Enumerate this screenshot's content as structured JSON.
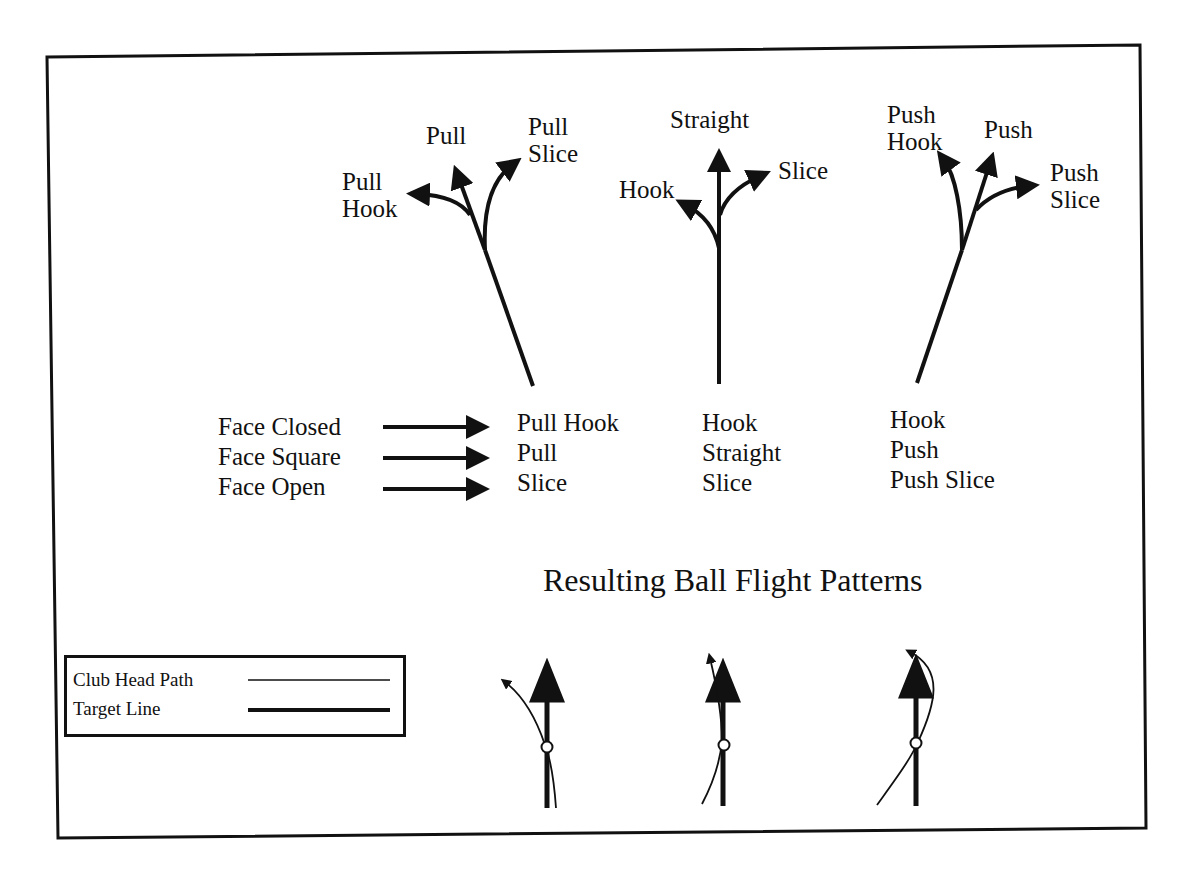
{
  "diagrams": {
    "pull": {
      "labels": {
        "pull_hook": "Pull\nHook",
        "pull": "Pull",
        "pull_slice": "Pull\nSlice"
      },
      "pull_hook_line1": "Pull",
      "pull_hook_line2": "Hook",
      "pull_label": "Pull",
      "pull_slice_line1": "Pull",
      "pull_slice_line2": "Slice"
    },
    "straight": {
      "straight_label": "Straight",
      "hook_label": "Hook",
      "slice_label": "Slice"
    },
    "push": {
      "push_hook_line1": "Push",
      "push_hook_line2": "Hook",
      "push_label": "Push",
      "push_slice_line1": "Push",
      "push_slice_line2": "Slice"
    }
  },
  "face_table": {
    "rows": [
      {
        "face": "Face Closed",
        "pull": "Pull Hook",
        "straight": "Hook",
        "push": "Hook"
      },
      {
        "face": "Face Square",
        "pull": "Pull",
        "straight": "Straight",
        "push": "Push"
      },
      {
        "face": "Face Open",
        "pull": "Slice",
        "straight": "Slice",
        "push": "Push Slice"
      }
    ]
  },
  "title": "Resulting Ball Flight Patterns",
  "legend": {
    "club_head_path": "Club Head Path",
    "target_line": "Target Line"
  },
  "colors": {
    "ink": "#111111",
    "background": "#ffffff"
  }
}
